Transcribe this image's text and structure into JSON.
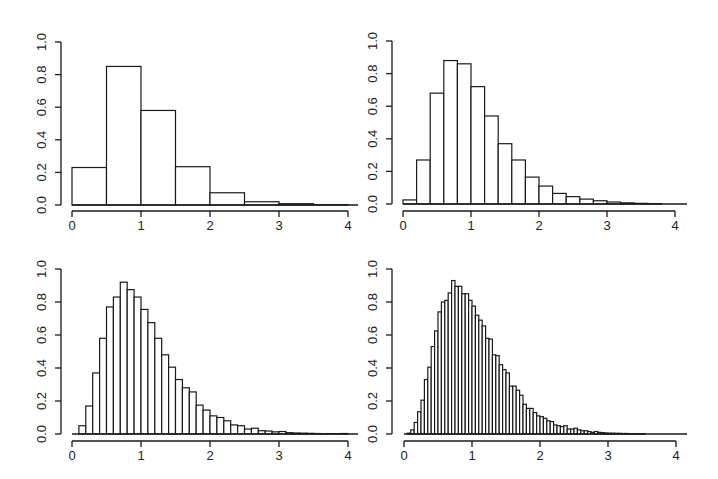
{
  "figure": {
    "panel_count": 4,
    "layout": "2x2 grid",
    "background": "#ffffff",
    "stroke_color": "#1a1a1a"
  },
  "chart_data": [
    {
      "type": "bar",
      "title": "",
      "xlabel": "",
      "ylabel": "",
      "bin_width": 0.5,
      "bin_start": 0,
      "xlim": [
        0,
        4
      ],
      "ylim": [
        0,
        1.0
      ],
      "x_ticks": [
        "0",
        "1",
        "2",
        "3",
        "4"
      ],
      "y_ticks": [
        "0.0",
        "0.2",
        "0.4",
        "0.6",
        "0.8",
        "1.0"
      ],
      "grid": false,
      "values": [
        0.23,
        0.85,
        0.58,
        0.235,
        0.075,
        0.02,
        0.008,
        0.002
      ]
    },
    {
      "type": "bar",
      "title": "",
      "xlabel": "",
      "ylabel": "",
      "bin_width": 0.2,
      "bin_start": 0,
      "xlim": [
        0,
        4
      ],
      "ylim": [
        0,
        1.0
      ],
      "x_ticks": [
        "0",
        "1",
        "2",
        "3",
        "4"
      ],
      "y_ticks": [
        "0.0",
        "0.2",
        "0.4",
        "0.6",
        "0.8",
        "1.0"
      ],
      "grid": false,
      "values": [
        0.025,
        0.27,
        0.68,
        0.88,
        0.86,
        0.72,
        0.54,
        0.37,
        0.27,
        0.165,
        0.11,
        0.065,
        0.045,
        0.03,
        0.02,
        0.012,
        0.007,
        0.004,
        0.002,
        0.001
      ]
    },
    {
      "type": "bar",
      "title": "",
      "xlabel": "",
      "ylabel": "",
      "bin_width": 0.1,
      "bin_start": 0,
      "xlim": [
        0,
        4
      ],
      "ylim": [
        0,
        1.0
      ],
      "x_ticks": [
        "0",
        "1",
        "2",
        "3",
        "4"
      ],
      "y_ticks": [
        "0.0",
        "0.2",
        "0.4",
        "0.6",
        "0.8",
        "1.0"
      ],
      "grid": false,
      "values": [
        0.0,
        0.05,
        0.17,
        0.37,
        0.58,
        0.77,
        0.83,
        0.92,
        0.875,
        0.83,
        0.755,
        0.675,
        0.58,
        0.48,
        0.405,
        0.33,
        0.28,
        0.255,
        0.175,
        0.145,
        0.11,
        0.1,
        0.08,
        0.055,
        0.05,
        0.03,
        0.035,
        0.02,
        0.018,
        0.013,
        0.015,
        0.008,
        0.006,
        0.005,
        0.004,
        0.003,
        0.002,
        0.002,
        0.002,
        0.003
      ]
    },
    {
      "type": "bar",
      "title": "",
      "xlabel": "",
      "ylabel": "",
      "bin_width": 0.05,
      "bin_start": 0,
      "xlim": [
        0,
        4
      ],
      "ylim": [
        0,
        1.0
      ],
      "x_ticks": [
        "0",
        "1",
        "2",
        "3",
        "4"
      ],
      "y_ticks": [
        "0.0",
        "0.2",
        "0.4",
        "0.6",
        "0.8",
        "1.0"
      ],
      "grid": false,
      "values": [
        0.0,
        0.005,
        0.025,
        0.07,
        0.135,
        0.205,
        0.33,
        0.405,
        0.53,
        0.625,
        0.74,
        0.8,
        0.81,
        0.855,
        0.93,
        0.895,
        0.895,
        0.85,
        0.85,
        0.81,
        0.775,
        0.72,
        0.69,
        0.655,
        0.58,
        0.575,
        0.48,
        0.475,
        0.42,
        0.39,
        0.37,
        0.29,
        0.29,
        0.265,
        0.235,
        0.18,
        0.155,
        0.155,
        0.13,
        0.11,
        0.105,
        0.095,
        0.08,
        0.075,
        0.055,
        0.05,
        0.045,
        0.05,
        0.03,
        0.03,
        0.035,
        0.025,
        0.02,
        0.02,
        0.015,
        0.01,
        0.015,
        0.01,
        0.008,
        0.006,
        0.005,
        0.005,
        0.004,
        0.004,
        0.003,
        0.003,
        0.002,
        0.002,
        0.002,
        0.002,
        0.002,
        0.001,
        0.001,
        0.001,
        0.001,
        0.001,
        0.001,
        0.001,
        0.001,
        0.001
      ]
    }
  ],
  "panels": [
    {
      "id": "top-left",
      "x0_px": 72,
      "x_unit_px": 69,
      "y0_px": 205,
      "y_unit_px": 163,
      "yaxis_x_px": 61,
      "xaxis_y_px": 211,
      "baseline_end_px": 358
    },
    {
      "id": "top-right",
      "x0_px": 403,
      "x_unit_px": 68,
      "y0_px": 204,
      "y_unit_px": 163,
      "yaxis_x_px": 392,
      "xaxis_y_px": 211,
      "baseline_end_px": 687
    },
    {
      "id": "bottom-left",
      "x0_px": 72,
      "x_unit_px": 69,
      "y0_px": 434,
      "y_unit_px": 165,
      "yaxis_x_px": 61,
      "xaxis_y_px": 441,
      "baseline_end_px": 358
    },
    {
      "id": "bottom-right",
      "x0_px": 404,
      "x_unit_px": 68,
      "y0_px": 434,
      "y_unit_px": 165,
      "yaxis_x_px": 392,
      "xaxis_y_px": 441,
      "baseline_end_px": 687
    }
  ]
}
